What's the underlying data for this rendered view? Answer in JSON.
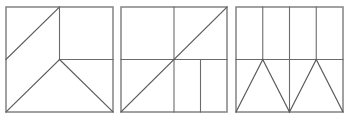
{
  "page": {
    "background_color": "#ffffff",
    "width": 349,
    "height": 119
  },
  "styles": {
    "frame_color": "#8a8a8a",
    "line_color": "#6b6b6b",
    "diagonal_color": "#5a5a5a",
    "frame_stroke_width": 1.6,
    "line_stroke_width": 1.1,
    "diagonal_stroke_width": 1.2
  },
  "figures": [
    {
      "id": "square-1",
      "name": "square-one",
      "label": "",
      "frame": {
        "x": 6,
        "y": 7,
        "width": 107,
        "height": 105
      },
      "description": "Square divided by a diagonal from left midpoint to top center, a vertical from top center to center, a horizontal from center to right edge, and two diagonals from center to the bottom corners.",
      "segments": [
        {
          "name": "diagonal-left-mid-to-top-center",
          "x1": 6,
          "y1": 59.5,
          "x2": 59.5,
          "y2": 7,
          "kind": "diagonal"
        },
        {
          "name": "vertical-top-center-to-center",
          "x1": 59.5,
          "y1": 7,
          "x2": 59.5,
          "y2": 59.5,
          "kind": "line"
        },
        {
          "name": "horizontal-center-to-right",
          "x1": 59.5,
          "y1": 59.5,
          "x2": 113,
          "y2": 59.5,
          "kind": "line"
        },
        {
          "name": "diagonal-center-to-bottom-left",
          "x1": 59.5,
          "y1": 59.5,
          "x2": 6,
          "y2": 112,
          "kind": "diagonal"
        },
        {
          "name": "diagonal-center-to-bottom-right",
          "x1": 59.5,
          "y1": 59.5,
          "x2": 113,
          "y2": 112,
          "kind": "diagonal"
        }
      ]
    },
    {
      "id": "square-2",
      "name": "square-two",
      "label": "",
      "frame": {
        "x": 121,
        "y": 7,
        "width": 106,
        "height": 105
      },
      "description": "Square divided by a full vertical center line, a full horizontal center line, a main diagonal from bottom-left to top-right corner, and an extra vertical line at three-quarters width in the lower half.",
      "segments": [
        {
          "name": "vertical-center-full",
          "x1": 174,
          "y1": 7,
          "x2": 174,
          "y2": 112,
          "kind": "line"
        },
        {
          "name": "horizontal-center-full",
          "x1": 121,
          "y1": 59.5,
          "x2": 227,
          "y2": 59.5,
          "kind": "line"
        },
        {
          "name": "main-diagonal-bottom-left-to-top-right",
          "x1": 121,
          "y1": 112,
          "x2": 227,
          "y2": 7,
          "kind": "diagonal"
        },
        {
          "name": "vertical-three-quarter-lower-half",
          "x1": 200.5,
          "y1": 59.5,
          "x2": 200.5,
          "y2": 112,
          "kind": "line"
        }
      ]
    },
    {
      "id": "square-3",
      "name": "square-three",
      "label": "",
      "frame": {
        "x": 236,
        "y": 7,
        "width": 107,
        "height": 105
      },
      "description": "Square with three vertical lines dividing the upper half into four columns, a full horizontal center line, a center vertical continuing through the lower half, and two triangles in the lower half with apexes at the quarter and three-quarter points.",
      "segments": [
        {
          "name": "vertical-quarter-upper-half",
          "x1": 262.75,
          "y1": 7,
          "x2": 262.75,
          "y2": 59.5,
          "kind": "line"
        },
        {
          "name": "vertical-center-upper-half",
          "x1": 289.5,
          "y1": 7,
          "x2": 289.5,
          "y2": 59.5,
          "kind": "line"
        },
        {
          "name": "vertical-three-quarter-upper-half",
          "x1": 316.25,
          "y1": 7,
          "x2": 316.25,
          "y2": 59.5,
          "kind": "line"
        },
        {
          "name": "horizontal-center-full",
          "x1": 236,
          "y1": 59.5,
          "x2": 343,
          "y2": 59.5,
          "kind": "line"
        },
        {
          "name": "vertical-center-lower-half",
          "x1": 289.5,
          "y1": 59.5,
          "x2": 289.5,
          "y2": 112,
          "kind": "line"
        },
        {
          "name": "triangle-left-side-up",
          "x1": 236,
          "y1": 112,
          "x2": 262.75,
          "y2": 59.5,
          "kind": "diagonal"
        },
        {
          "name": "triangle-left-side-down",
          "x1": 262.75,
          "y1": 59.5,
          "x2": 289.5,
          "y2": 112,
          "kind": "diagonal"
        },
        {
          "name": "triangle-right-side-up",
          "x1": 289.5,
          "y1": 112,
          "x2": 316.25,
          "y2": 59.5,
          "kind": "diagonal"
        },
        {
          "name": "triangle-right-side-down",
          "x1": 316.25,
          "y1": 59.5,
          "x2": 343,
          "y2": 112,
          "kind": "diagonal"
        }
      ]
    }
  ]
}
